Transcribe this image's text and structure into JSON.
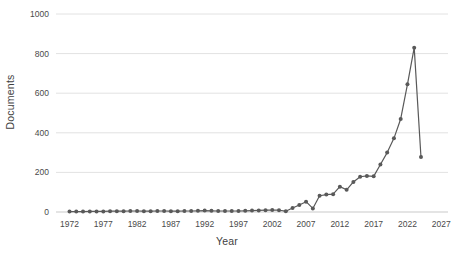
{
  "chart_data": {
    "type": "line",
    "title": "",
    "xlabel": "Year",
    "ylabel": "Documents",
    "xlim": [
      1970,
      2028
    ],
    "ylim": [
      0,
      1000
    ],
    "grid": true,
    "legend": false,
    "marker": "circle",
    "series_color": "#595959",
    "x_ticks": [
      1972,
      1977,
      1982,
      1987,
      1992,
      1997,
      2002,
      2007,
      2012,
      2017,
      2022,
      2027
    ],
    "y_ticks": [
      0,
      200,
      400,
      600,
      800,
      1000
    ],
    "x": [
      1972,
      1973,
      1974,
      1975,
      1976,
      1977,
      1978,
      1979,
      1980,
      1981,
      1982,
      1983,
      1984,
      1985,
      1986,
      1987,
      1988,
      1989,
      1990,
      1991,
      1992,
      1993,
      1994,
      1995,
      1996,
      1997,
      1998,
      1999,
      2000,
      2001,
      2002,
      2003,
      2004,
      2005,
      2006,
      2007,
      2008,
      2009,
      2010,
      2011,
      2012,
      2013,
      2014,
      2015,
      2016,
      2017,
      2018,
      2019,
      2020,
      2021,
      2022,
      2023
    ],
    "values": [
      2,
      2,
      2,
      3,
      3,
      3,
      4,
      4,
      4,
      5,
      5,
      4,
      4,
      5,
      5,
      4,
      4,
      5,
      5,
      6,
      7,
      6,
      5,
      5,
      5,
      5,
      6,
      7,
      8,
      9,
      10,
      9,
      4,
      20,
      35,
      52,
      18,
      82,
      88,
      90,
      128,
      112,
      152,
      178,
      182,
      180,
      240,
      300,
      372,
      470,
      645,
      830
    ],
    "final_point_value": 278,
    "peak_value": 830,
    "peak_year": 2022
  },
  "axes": {
    "y_title": "Documents",
    "x_title": "Year"
  }
}
